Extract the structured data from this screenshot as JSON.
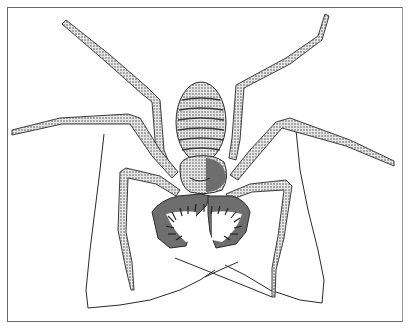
{
  "image": {
    "subject": "whip spider illustration",
    "style": "black ink stipple line drawing",
    "colors": {
      "background": "#ffffff",
      "ink": "#2a2a2a",
      "frame": "#6a6a6a",
      "shade": "#5a5a5a"
    }
  }
}
